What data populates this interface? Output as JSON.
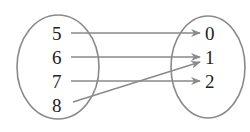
{
  "diagram": {
    "type": "mapping",
    "colors": {
      "stroke": "#8a8a8a",
      "text": "#222222",
      "background": "#ffffff"
    },
    "domain": {
      "elements": [
        {
          "label": "5",
          "x": 58,
          "y": 33
        },
        {
          "label": "6",
          "x": 58,
          "y": 58
        },
        {
          "label": "7",
          "x": 58,
          "y": 82
        },
        {
          "label": "8",
          "x": 58,
          "y": 105
        }
      ]
    },
    "range": {
      "elements": [
        {
          "label": "0",
          "x": 212,
          "y": 33
        },
        {
          "label": "1",
          "x": 212,
          "y": 58
        },
        {
          "label": "2",
          "x": 212,
          "y": 82
        }
      ]
    },
    "mappings": [
      {
        "from": "5",
        "to": "0"
      },
      {
        "from": "6",
        "to": "1"
      },
      {
        "from": "7",
        "to": "2"
      },
      {
        "from": "8",
        "to": "1"
      }
    ]
  }
}
